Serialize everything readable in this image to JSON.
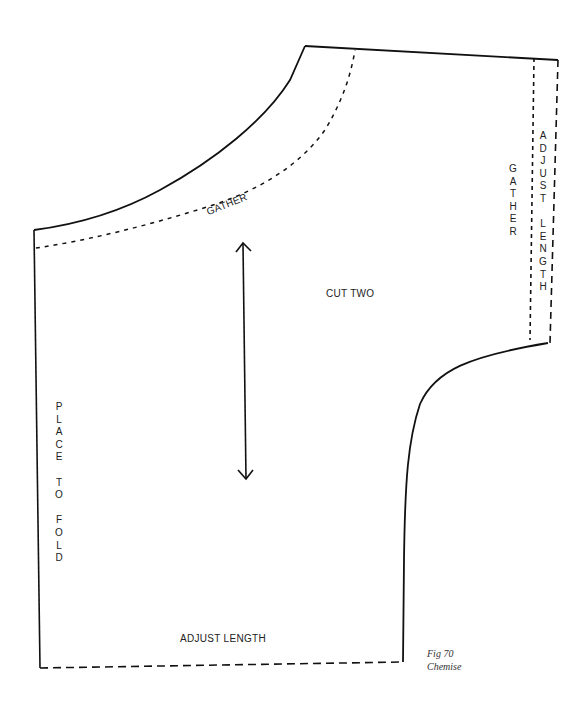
{
  "figure": {
    "number_label": "Fig 70",
    "title": "Chemise"
  },
  "labels": {
    "gather_curve": "GATHER",
    "cut": "CUT TWO",
    "bottom_adjust": "ADJUST LENGTH",
    "fold": [
      "P",
      "L",
      "A",
      "C",
      "E",
      "",
      "T",
      "O",
      "",
      "F",
      "O",
      "L",
      "D"
    ],
    "gather_side": [
      "G",
      "A",
      "T",
      "H",
      "E",
      "R"
    ],
    "adjust_side": [
      "A",
      "D",
      "J",
      "U",
      "S",
      "T",
      "",
      "L",
      "E",
      "N",
      "G",
      "T",
      "H"
    ]
  },
  "colors": {
    "line": "#111111",
    "background": "#ffffff"
  }
}
